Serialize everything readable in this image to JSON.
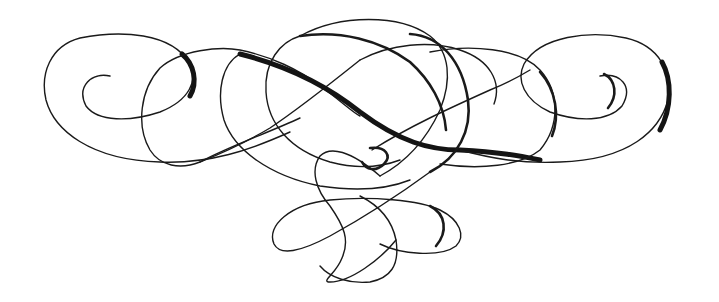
{
  "image": {
    "description": "Decorative calligraphic flourish ornament",
    "ink_color": "#1a1a1a",
    "background_color": "#ffffff"
  }
}
